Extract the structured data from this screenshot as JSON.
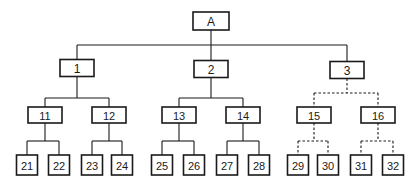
{
  "diagram": {
    "type": "tree",
    "root": "A",
    "nodes": [
      {
        "id": "A",
        "label": "A",
        "level": 0,
        "parent": null
      },
      {
        "id": "1",
        "label": "1",
        "level": 1,
        "parent": "A"
      },
      {
        "id": "2",
        "label": "2",
        "level": 1,
        "parent": "A"
      },
      {
        "id": "3",
        "label": "3",
        "level": 1,
        "parent": "A"
      },
      {
        "id": "11",
        "label": "11",
        "level": 2,
        "parent": "1"
      },
      {
        "id": "12",
        "label": "12",
        "level": 2,
        "parent": "1"
      },
      {
        "id": "13",
        "label": "13",
        "level": 2,
        "parent": "2"
      },
      {
        "id": "14",
        "label": "14",
        "level": 2,
        "parent": "2"
      },
      {
        "id": "15",
        "label": "15",
        "level": 2,
        "parent": "3"
      },
      {
        "id": "16",
        "label": "16",
        "level": 2,
        "parent": "3"
      },
      {
        "id": "21",
        "label": "21",
        "level": 3,
        "parent": "11"
      },
      {
        "id": "22",
        "label": "22",
        "level": 3,
        "parent": "11"
      },
      {
        "id": "23",
        "label": "23",
        "level": 3,
        "parent": "12"
      },
      {
        "id": "24",
        "label": "24",
        "level": 3,
        "parent": "12"
      },
      {
        "id": "25",
        "label": "25",
        "level": 3,
        "parent": "13"
      },
      {
        "id": "26",
        "label": "26",
        "level": 3,
        "parent": "13"
      },
      {
        "id": "27",
        "label": "27",
        "level": 3,
        "parent": "14"
      },
      {
        "id": "28",
        "label": "28",
        "level": 3,
        "parent": "14"
      },
      {
        "id": "29",
        "label": "29",
        "level": 3,
        "parent": "15"
      },
      {
        "id": "30",
        "label": "30",
        "level": 3,
        "parent": "15"
      },
      {
        "id": "31",
        "label": "31",
        "level": 3,
        "parent": "16"
      },
      {
        "id": "32",
        "label": "32",
        "level": 3,
        "parent": "16"
      }
    ],
    "dashed_subtrees": [
      "3"
    ],
    "edge_style": {
      "solid": "#1a1a1a",
      "dashed": "#1a1a1a"
    }
  }
}
